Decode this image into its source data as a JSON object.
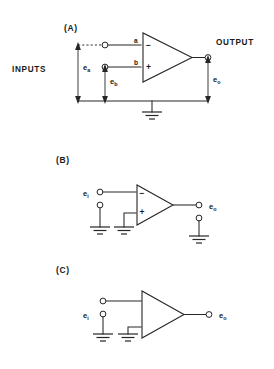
{
  "figure": {
    "background_color": "#ffffff",
    "line_color": "#262626",
    "text_color": "#1a1a1a"
  },
  "sections": {
    "a": {
      "label": "(A)",
      "inputs_label": "INPUTS",
      "output_label": "OUTPUT",
      "pin_a": "a",
      "pin_b": "b",
      "sign_minus": "−",
      "sign_plus": "+",
      "signal_a": {
        "base": "e",
        "sub": "a"
      },
      "signal_b": {
        "base": "e",
        "sub": "b"
      },
      "signal_out": {
        "base": "e",
        "sub": "o"
      },
      "ground_count": 1,
      "description": "Differential amplifier with two inputs a and b referenced to ground, single output"
    },
    "b": {
      "label": "(B)",
      "signal_in": {
        "base": "e",
        "sub": "i"
      },
      "signal_out": {
        "base": "e",
        "sub": "o"
      },
      "sign_minus": "−",
      "sign_plus": "+",
      "ground_count": 3,
      "description": "Inverting configuration: input to minus terminal, plus terminal grounded"
    },
    "c": {
      "label": "(C)",
      "signal_in": {
        "base": "e",
        "sub": "i"
      },
      "signal_out": {
        "base": "e",
        "sub": "o"
      },
      "ground_count": 2,
      "description": "Single-ended amplifier symbol without polarity marks, lower terminal grounded"
    }
  }
}
